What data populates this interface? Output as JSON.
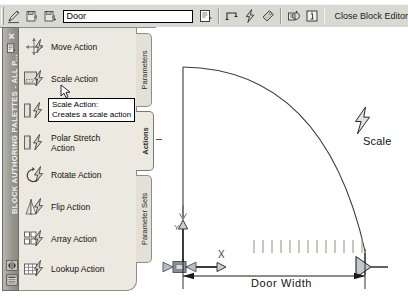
{
  "window": {
    "app": "AutoCAD Block Editor"
  },
  "toolbar": {
    "icons": [
      {
        "name": "edit-block-definition-icon",
        "glyph": "pencil"
      },
      {
        "name": "save-block-definition-icon",
        "glyph": "save-block"
      },
      {
        "name": "save-block-as-icon",
        "glyph": "save-block-as"
      },
      {
        "name": "block-authoring-palettes-icon",
        "glyph": "palettes"
      },
      {
        "name": "parameter-icon",
        "glyph": "parameter"
      },
      {
        "name": "action-icon",
        "glyph": "lightning"
      },
      {
        "name": "attribute-definition-icon",
        "glyph": "tag"
      },
      {
        "name": "update-parameter-visibility-icon",
        "glyph": "update-params"
      },
      {
        "name": "learn-about-dynamic-blocks-icon",
        "glyph": "info"
      }
    ],
    "block_name_value": "Door",
    "block_name_placeholder": "Block name",
    "close_label": "Close Block Editor"
  },
  "palette": {
    "title": "BLOCK AUTHORING PALETTES - ALL P...",
    "close_label": "×",
    "properties_icon": "properties-icon",
    "autohide_icon": "auto-hide-icon",
    "menu_icon": "palette-menu-icon",
    "tabs": [
      {
        "id": "parameters",
        "label": "Parameters",
        "active": false
      },
      {
        "id": "actions",
        "label": "Actions",
        "active": true
      },
      {
        "id": "parameter-sets",
        "label": "Parameter Sets",
        "active": false
      }
    ],
    "actions": [
      {
        "id": "move",
        "label": "Move Action",
        "icon": "move-action-icon"
      },
      {
        "id": "scale",
        "label": "Scale Action",
        "icon": "scale-action-icon"
      },
      {
        "id": "stretch",
        "label": "Stretch Action",
        "icon": "stretch-action-icon"
      },
      {
        "id": "polar-stretch",
        "label": "Polar Stretch Action",
        "icon": "polar-stretch-action-icon"
      },
      {
        "id": "rotate",
        "label": "Rotate Action",
        "icon": "rotate-action-icon"
      },
      {
        "id": "flip",
        "label": "Flip Action",
        "icon": "flip-action-icon"
      },
      {
        "id": "array",
        "label": "Array Action",
        "icon": "array-action-icon"
      },
      {
        "id": "lookup",
        "label": "Lookup Action",
        "icon": "lookup-action-icon"
      }
    ],
    "tooltip": {
      "title": "Scale Action:",
      "body": "Creates a scale action"
    }
  },
  "canvas": {
    "scale_action_label": "Scale",
    "dimension_label": "Door  Width",
    "axis_x_label": "X",
    "axis_y_label": "Y",
    "grip_base_name": "base-point-grip",
    "grip_stretch_name": "linear-parameter-grip",
    "hatch_tick_count": 13,
    "colors": {
      "geometry": "#3a3a3a",
      "grip": "#9aa0a6",
      "dimension": "#1a1a1a"
    }
  }
}
